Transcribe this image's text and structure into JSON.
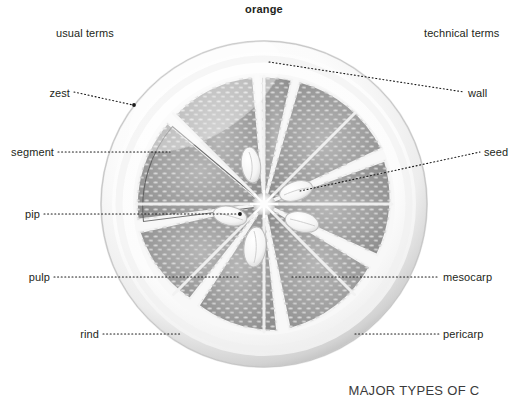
{
  "title": "orange",
  "columns": {
    "left_header": "usual terms",
    "right_header": "technical terms"
  },
  "labels_left": [
    {
      "key": "zest",
      "text": "zest"
    },
    {
      "key": "segment",
      "text": "segment"
    },
    {
      "key": "pip",
      "text": "pip"
    },
    {
      "key": "pulp",
      "text": "pulp"
    },
    {
      "key": "rind",
      "text": "rind"
    }
  ],
  "labels_right": [
    {
      "key": "wall",
      "text": "wall"
    },
    {
      "key": "seed",
      "text": "seed"
    },
    {
      "key": "mesocarp",
      "text": "mesocarp"
    },
    {
      "key": "pericarp",
      "text": "pericarp"
    }
  ],
  "footer_text": "MAJOR TYPES OF C",
  "colors": {
    "text": "#231f20",
    "leader_line": "#1a1a1a",
    "rind_outer": "#c9c9c9",
    "rind_inner": "#f6f6f6",
    "pulp_fill": "#9a9a9a",
    "pulp_dark": "#8a8a8a",
    "vesicle": "#c4c4c4",
    "membrane": "#efefef",
    "seed_fill": "#f2f2f2",
    "background": "#ffffff"
  },
  "figure": {
    "name": "orange-cross-section",
    "center_x": 264,
    "center_y": 204,
    "radius": 163,
    "segment_count": 8,
    "seed_count": 5
  }
}
